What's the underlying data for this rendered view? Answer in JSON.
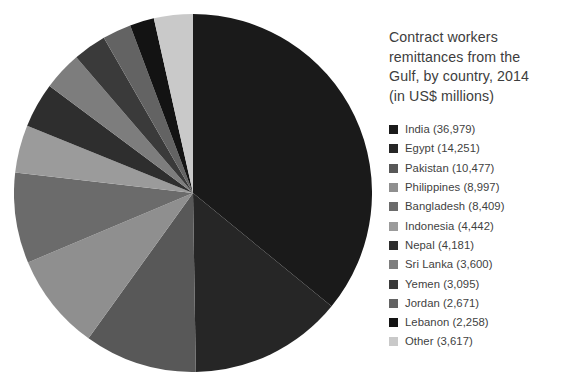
{
  "chart_data": {
    "type": "pie",
    "title": "Contract workers remittances from the Gulf, by country, 2014 (in US$ millions)",
    "title_lines": "Contract workers\nremittances from the\nGulf, by country, 2014\n(in US$ millions)",
    "units": "US$ millions",
    "year": "2014",
    "total": 102977,
    "start_angle_deg": 0,
    "direction": "clockwise",
    "legend_position": "right",
    "grid": false,
    "xlabel": "",
    "ylabel": "",
    "categories": [
      "India",
      "Egypt",
      "Pakistan",
      "Philippines",
      "Bangladesh",
      "Indonesia",
      "Nepal",
      "Sri Lanka",
      "Yemen",
      "Jordan",
      "Lebanon",
      "Other"
    ],
    "values": [
      36979,
      14251,
      10477,
      8997,
      8409,
      4442,
      4181,
      3600,
      3095,
      2671,
      2258,
      3617
    ],
    "colors": [
      "#1a1a1a",
      "#262626",
      "#585858",
      "#8f8f8f",
      "#6b6b6b",
      "#9b9b9b",
      "#2e2e2e",
      "#7d7d7d",
      "#3a3a3a",
      "#636363",
      "#131313",
      "#c9c9c9"
    ],
    "slices": [
      {
        "label": "India (36,979)",
        "name": "India",
        "value": 36979,
        "value_text": "36,979",
        "color": "#1a1a1a"
      },
      {
        "label": "Egypt (14,251)",
        "name": "Egypt",
        "value": 14251,
        "value_text": "14,251",
        "color": "#262626"
      },
      {
        "label": "Pakistan (10,477)",
        "name": "Pakistan",
        "value": 10477,
        "value_text": "10,477",
        "color": "#585858"
      },
      {
        "label": "Philippines (8,997)",
        "name": "Philippines",
        "value": 8997,
        "value_text": "8,997",
        "color": "#8f8f8f"
      },
      {
        "label": "Bangladesh (8,409)",
        "name": "Bangladesh",
        "value": 8409,
        "value_text": "8,409",
        "color": "#6b6b6b"
      },
      {
        "label": "Indonesia (4,442)",
        "name": "Indonesia",
        "value": 4442,
        "value_text": "4,442",
        "color": "#9b9b9b"
      },
      {
        "label": "Nepal (4,181)",
        "name": "Nepal",
        "value": 4181,
        "value_text": "4,181",
        "color": "#2e2e2e"
      },
      {
        "label": "Sri Lanka (3,600)",
        "name": "Sri Lanka",
        "value": 3600,
        "value_text": "3,600",
        "color": "#7d7d7d"
      },
      {
        "label": "Yemen (3,095)",
        "name": "Yemen",
        "value": 3095,
        "value_text": "3,095",
        "color": "#3a3a3a"
      },
      {
        "label": "Jordan (2,671)",
        "name": "Jordan",
        "value": 2671,
        "value_text": "2,671",
        "color": "#636363"
      },
      {
        "label": "Lebanon (2,258)",
        "name": "Lebanon",
        "value": 2258,
        "value_text": "2,258",
        "color": "#131313"
      },
      {
        "label": "Other (3,617)",
        "name": "Other",
        "value": 3617,
        "value_text": "3,617",
        "color": "#c9c9c9"
      }
    ]
  },
  "legend": {
    "items": [
      {
        "label": "India (36,979)"
      },
      {
        "label": "Egypt (14,251)"
      },
      {
        "label": "Pakistan (10,477)"
      },
      {
        "label": "Philippines (8,997)"
      },
      {
        "label": "Bangladesh (8,409)"
      },
      {
        "label": "Indonesia (4,442)"
      },
      {
        "label": "Nepal (4,181)"
      },
      {
        "label": "Sri Lanka (3,600)"
      },
      {
        "label": "Yemen (3,095)"
      },
      {
        "label": "Jordan (2,671)"
      },
      {
        "label": "Lebanon (2,258)"
      },
      {
        "label": "Other (3,617)"
      }
    ]
  }
}
